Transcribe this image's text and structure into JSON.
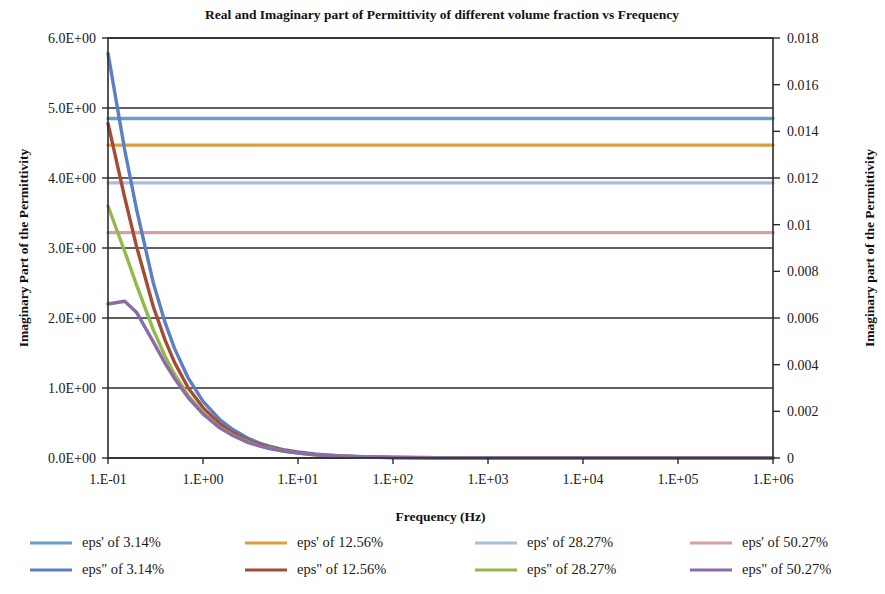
{
  "chart_data": {
    "type": "line",
    "title": "Real and Imaginary part of  Permittivity of different volume fraction vs Frequency",
    "xlabel": "Frequency (Hz)",
    "ylabel": "Imaginary  Part of the Permittivity",
    "y2label": "Imaginary part of the Permittivity",
    "xscale": "log",
    "xlim": [
      0.1,
      1000000
    ],
    "xticks": [
      0.1,
      1,
      10,
      100,
      1000,
      10000,
      100000,
      1000000
    ],
    "xticklabels": [
      "1.E-01",
      "1.E+00",
      "1.E+01",
      "1.E+02",
      "1.E+03",
      "1.E+04",
      "1.E+05",
      "1.E+06"
    ],
    "ylim": [
      0,
      6
    ],
    "yticks": [
      0,
      1,
      2,
      3,
      4,
      5,
      6
    ],
    "yticklabels": [
      "0.0E+00",
      "1.0E+00",
      "2.0E+00",
      "3.0E+00",
      "4.0E+00",
      "5.0E+00",
      "6.0E+00"
    ],
    "y2lim": [
      0,
      0.018
    ],
    "y2ticks": [
      0,
      0.002,
      0.004,
      0.006,
      0.008,
      0.01,
      0.012,
      0.014,
      0.016,
      0.018
    ],
    "y2ticklabels": [
      "0",
      "0.002",
      "0.004",
      "0.006",
      "0.008",
      "0.01",
      "0.012",
      "0.014",
      "0.016",
      "0.018"
    ],
    "grid": true,
    "legend_position": "bottom",
    "x": [
      0.1,
      0.15,
      0.2,
      0.3,
      0.4,
      0.5,
      0.7,
      1,
      1.5,
      2,
      3,
      4,
      5,
      7,
      10,
      15,
      20,
      30,
      50,
      100,
      300,
      1000,
      10000,
      100000,
      1000000
    ],
    "series": [
      {
        "name": "eps' of 3.14%",
        "axis": "left",
        "color": "#6C9EC3",
        "values": [
          4.85,
          4.85,
          4.85,
          4.85,
          4.85,
          4.85,
          4.85,
          4.85,
          4.85,
          4.85,
          4.85,
          4.85,
          4.85,
          4.85,
          4.85,
          4.85,
          4.85,
          4.85,
          4.85,
          4.85,
          4.85,
          4.85,
          4.85,
          4.85,
          4.85
        ]
      },
      {
        "name": "eps' of 12.56%",
        "axis": "left",
        "color": "#D9A03C",
        "values": [
          4.47,
          4.47,
          4.47,
          4.47,
          4.47,
          4.47,
          4.47,
          4.47,
          4.47,
          4.47,
          4.47,
          4.47,
          4.47,
          4.47,
          4.47,
          4.47,
          4.47,
          4.47,
          4.47,
          4.47,
          4.47,
          4.47,
          4.47,
          4.47,
          4.47
        ]
      },
      {
        "name": "eps' of 28.27%",
        "axis": "left",
        "color": "#A9BDDF",
        "values": [
          3.93,
          3.93,
          3.93,
          3.93,
          3.93,
          3.93,
          3.93,
          3.93,
          3.93,
          3.93,
          3.93,
          3.93,
          3.93,
          3.93,
          3.93,
          3.93,
          3.93,
          3.93,
          3.93,
          3.93,
          3.93,
          3.93,
          3.93,
          3.93,
          3.93
        ]
      },
      {
        "name": "eps' of 50.27%",
        "axis": "left",
        "color": "#D6A0A0",
        "values": [
          3.22,
          3.22,
          3.22,
          3.22,
          3.22,
          3.22,
          3.22,
          3.22,
          3.22,
          3.22,
          3.22,
          3.22,
          3.22,
          3.22,
          3.22,
          3.22,
          3.22,
          3.22,
          3.22,
          3.22,
          3.22,
          3.22,
          3.22,
          3.22,
          3.22
        ]
      },
      {
        "name": "eps\" of 3.14%",
        "axis": "left",
        "color": "#5B7FC4",
        "values": [
          5.78,
          4.4,
          3.55,
          2.5,
          1.93,
          1.57,
          1.14,
          0.81,
          0.55,
          0.42,
          0.28,
          0.21,
          0.17,
          0.12,
          0.085,
          0.057,
          0.043,
          0.029,
          0.017,
          0.009,
          0.003,
          0.001,
          0.0,
          0.0,
          0.0
        ]
      },
      {
        "name": "eps\" of 12.56%",
        "axis": "left",
        "color": "#A64B32",
        "values": [
          4.78,
          3.72,
          3.02,
          2.16,
          1.68,
          1.37,
          1.0,
          0.72,
          0.49,
          0.37,
          0.25,
          0.19,
          0.15,
          0.11,
          0.077,
          0.052,
          0.039,
          0.026,
          0.016,
          0.008,
          0.003,
          0.001,
          0.0,
          0.0,
          0.0
        ]
      },
      {
        "name": "eps\" of 28.27%",
        "axis": "left",
        "color": "#94B84A",
        "values": [
          3.6,
          2.95,
          2.47,
          1.83,
          1.45,
          1.2,
          0.89,
          0.65,
          0.44,
          0.34,
          0.23,
          0.17,
          0.14,
          0.1,
          0.07,
          0.047,
          0.036,
          0.024,
          0.015,
          0.007,
          0.0025,
          0.001,
          0.0,
          0.0,
          0.0
        ]
      },
      {
        "name": "eps\" of 50.27%",
        "axis": "left",
        "color": "#8B6BA8",
        "values": [
          2.2,
          2.24,
          2.08,
          1.66,
          1.35,
          1.14,
          0.86,
          0.63,
          0.43,
          0.33,
          0.22,
          0.17,
          0.135,
          0.098,
          0.069,
          0.046,
          0.035,
          0.023,
          0.014,
          0.007,
          0.0024,
          0.0008,
          0.0,
          0.0,
          0.0
        ]
      }
    ]
  },
  "legend": {
    "items": [
      {
        "label": "eps' of 3.14%",
        "color": "#6C9EC3"
      },
      {
        "label": "eps' of 12.56%",
        "color": "#D9A03C"
      },
      {
        "label": "eps' of 28.27%",
        "color": "#A9BDDF"
      },
      {
        "label": "eps' of 50.27%",
        "color": "#D6A0A0"
      },
      {
        "label": "eps\" of 3.14%",
        "color": "#5B7FC4"
      },
      {
        "label": "eps\" of 12.56%",
        "color": "#A64B32"
      },
      {
        "label": "eps\" of 28.27%",
        "color": "#94B84A"
      },
      {
        "label": "eps\" of 50.27%",
        "color": "#8B6BA8"
      }
    ]
  }
}
